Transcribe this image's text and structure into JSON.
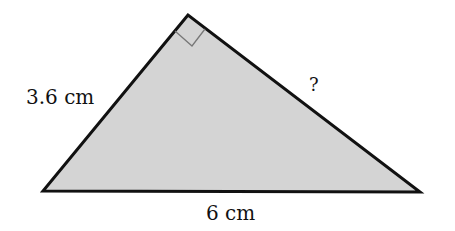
{
  "diagram": {
    "type": "right-triangle",
    "vertices": {
      "apex": [
        188,
        15
      ],
      "left": [
        43,
        191
      ],
      "right": [
        420,
        192
      ]
    },
    "right_angle_at": "apex",
    "fill_color": "#d4d4d4",
    "stroke_color": "#111111",
    "marker_color": "#777777",
    "labels": {
      "left_side": "3.6 cm",
      "bottom_side": "6 cm",
      "right_side": "?"
    }
  }
}
